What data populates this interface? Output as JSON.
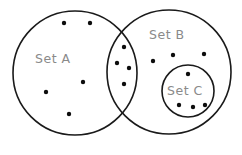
{
  "diagram": {
    "type": "venn",
    "sets": [
      {
        "id": "A",
        "label": "Set A",
        "cx": 75,
        "cy": 73,
        "r": 62,
        "label_x": 35,
        "label_y": 63
      },
      {
        "id": "B",
        "label": "Set B",
        "cx": 169,
        "cy": 72,
        "r": 62,
        "label_x": 149,
        "label_y": 39
      },
      {
        "id": "C",
        "label": "Set C",
        "cx": 188,
        "cy": 91,
        "r": 26,
        "label_x": 167,
        "label_y": 95
      }
    ],
    "regions": {
      "A_only": {
        "count": 5,
        "points": [
          [
            64,
            23
          ],
          [
            90,
            23
          ],
          [
            83,
            82
          ],
          [
            46,
            92
          ],
          [
            69,
            114
          ]
        ]
      },
      "A_and_B": {
        "count": 4,
        "points": [
          [
            124,
            47
          ],
          [
            117,
            63
          ],
          [
            129,
            68
          ],
          [
            124,
            84
          ]
        ]
      },
      "B_only": {
        "count": 3,
        "points": [
          [
            153,
            61
          ],
          [
            173,
            55
          ],
          [
            204,
            54
          ]
        ]
      },
      "C_subset_of_B": {
        "count": 4,
        "points": [
          [
            188,
            74
          ],
          [
            179,
            105
          ],
          [
            193,
            107
          ],
          [
            205,
            105
          ]
        ]
      }
    },
    "colors": {
      "stroke": "#1a1a1a",
      "dot": "#0d0d0d",
      "label": "#8a8a8a",
      "background": "#ffffff"
    }
  }
}
